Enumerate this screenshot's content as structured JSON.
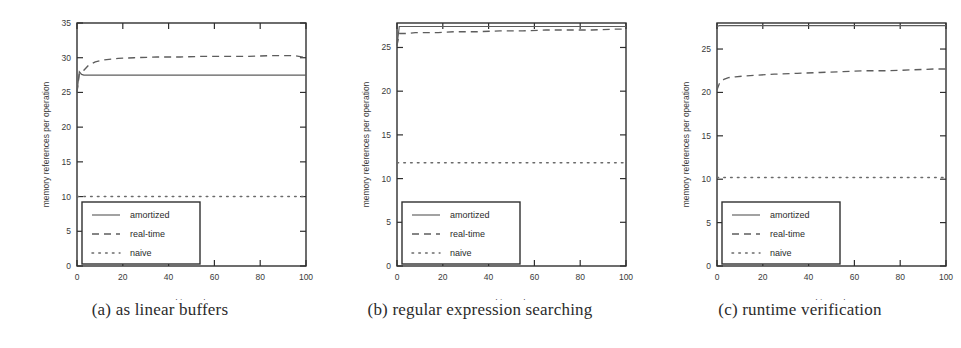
{
  "figure": {
    "series_names": [
      "amortized",
      "real-time",
      "naive"
    ],
    "legend": {
      "amortized_label": "amortized",
      "realtime_label": "real-time",
      "naive_label": "naive"
    },
    "axis": {
      "xlabel_text": "history",
      "xlabel_symbol": "h",
      "ylabel": "memory references per operation"
    }
  },
  "panels": [
    {
      "id": "panel-a",
      "caption": "(a) as linear buffers",
      "xticks": [
        "0",
        "20",
        "40",
        "60",
        "80",
        "100"
      ],
      "yticks": [
        "0",
        "5",
        "10",
        "15",
        "20",
        "25",
        "30",
        "35"
      ]
    },
    {
      "id": "panel-b",
      "caption": "(b) regular expression searching",
      "xticks": [
        "0",
        "20",
        "40",
        "60",
        "80",
        "100"
      ],
      "yticks": [
        "0",
        "5",
        "10",
        "15",
        "20",
        "25"
      ]
    },
    {
      "id": "panel-c",
      "caption": "(c) runtime verification",
      "xticks": [
        "0",
        "20",
        "40",
        "60",
        "80",
        "100"
      ],
      "yticks": [
        "0",
        "5",
        "10",
        "15",
        "20",
        "25"
      ]
    }
  ],
  "chart_data": [
    {
      "type": "line",
      "title": "(a) as linear buffers",
      "xlabel": "history h",
      "ylabel": "memory references per operation",
      "xlim": [
        0,
        100
      ],
      "ylim": [
        0,
        35
      ],
      "xticks": [
        0,
        20,
        40,
        60,
        80,
        100
      ],
      "yticks": [
        0,
        5,
        10,
        15,
        20,
        25,
        30,
        35
      ],
      "grid": false,
      "legend_position": "lower-left",
      "x": [
        0,
        1,
        2,
        3,
        5,
        8,
        12,
        18,
        25,
        35,
        45,
        55,
        65,
        75,
        85,
        95,
        100
      ],
      "series": [
        {
          "name": "amortized",
          "style": "solid",
          "values": [
            25.0,
            28.0,
            27.6,
            27.5,
            27.5,
            27.5,
            27.5,
            27.5,
            27.5,
            27.5,
            27.5,
            27.5,
            27.5,
            27.5,
            27.5,
            27.5,
            27.5
          ]
        },
        {
          "name": "real-time",
          "style": "dashed",
          "values": [
            25.0,
            27.6,
            27.8,
            28.2,
            28.9,
            29.4,
            29.7,
            29.9,
            30.0,
            30.1,
            30.1,
            30.2,
            30.2,
            30.2,
            30.3,
            30.3,
            30.0
          ]
        },
        {
          "name": "naive",
          "style": "dotted",
          "values": [
            10.0,
            10.0,
            10.0,
            10.0,
            10.0,
            10.0,
            10.0,
            10.0,
            10.0,
            10.0,
            10.0,
            10.0,
            10.0,
            10.0,
            10.0,
            10.0,
            10.0
          ]
        }
      ]
    },
    {
      "type": "line",
      "title": "(b) regular expression searching",
      "xlabel": "history h",
      "ylabel": "memory references per operation",
      "xlim": [
        0,
        100
      ],
      "ylim": [
        0,
        27.8
      ],
      "xticks": [
        0,
        20,
        40,
        60,
        80,
        100
      ],
      "yticks": [
        0,
        5,
        10,
        15,
        20,
        25
      ],
      "grid": false,
      "legend_position": "lower-left",
      "x": [
        0,
        1,
        2,
        3,
        5,
        8,
        12,
        18,
        25,
        35,
        45,
        55,
        65,
        75,
        85,
        95,
        100
      ],
      "series": [
        {
          "name": "amortized",
          "style": "solid",
          "values": [
            25.2,
            27.4,
            27.4,
            27.4,
            27.4,
            27.4,
            27.4,
            27.4,
            27.4,
            27.4,
            27.4,
            27.4,
            27.4,
            27.4,
            27.4,
            27.4,
            27.4
          ]
        },
        {
          "name": "real-time",
          "style": "dashed",
          "values": [
            25.2,
            26.6,
            26.6,
            26.6,
            26.6,
            26.7,
            26.7,
            26.7,
            26.8,
            26.8,
            26.9,
            26.9,
            27.0,
            27.0,
            27.0,
            27.1,
            27.1
          ]
        },
        {
          "name": "naive",
          "style": "dotted",
          "values": [
            11.8,
            11.8,
            11.8,
            11.8,
            11.8,
            11.8,
            11.8,
            11.8,
            11.8,
            11.8,
            11.8,
            11.8,
            11.8,
            11.8,
            11.8,
            11.8,
            11.8
          ]
        }
      ]
    },
    {
      "type": "line",
      "title": "(c) runtime verification",
      "xlabel": "history h",
      "ylabel": "memory references per operation",
      "xlim": [
        0,
        100
      ],
      "ylim": [
        0,
        28.0
      ],
      "xticks": [
        0,
        20,
        40,
        60,
        80,
        100
      ],
      "yticks": [
        0,
        5,
        10,
        15,
        20,
        25
      ],
      "grid": false,
      "legend_position": "lower-left",
      "x": [
        0,
        1,
        2,
        3,
        5,
        8,
        12,
        18,
        25,
        35,
        45,
        55,
        65,
        75,
        85,
        95,
        100
      ],
      "series": [
        {
          "name": "amortized",
          "style": "solid",
          "values": [
            27.6,
            27.7,
            27.7,
            27.7,
            27.7,
            27.7,
            27.7,
            27.7,
            27.7,
            27.7,
            27.7,
            27.7,
            27.7,
            27.7,
            27.7,
            27.7,
            27.7
          ]
        },
        {
          "name": "real-time",
          "style": "dashed",
          "values": [
            20.3,
            21.0,
            21.3,
            21.5,
            21.7,
            21.8,
            21.9,
            22.0,
            22.1,
            22.2,
            22.3,
            22.4,
            22.5,
            22.5,
            22.6,
            22.7,
            22.7
          ]
        },
        {
          "name": "naive",
          "style": "dotted",
          "values": [
            10.2,
            10.2,
            10.2,
            10.2,
            10.2,
            10.2,
            10.2,
            10.2,
            10.2,
            10.2,
            10.2,
            10.2,
            10.2,
            10.2,
            10.2,
            10.2,
            10.2
          ]
        }
      ]
    }
  ]
}
